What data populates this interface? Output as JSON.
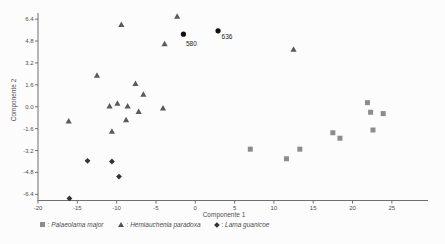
{
  "chart_data": {
    "type": "scatter",
    "title": "",
    "xlabel": "Componente 1",
    "ylabel": "Componente 2",
    "xlim": [
      -20,
      29.6
    ],
    "ylim": [
      -6.85,
      6.85
    ],
    "grid": false,
    "legend_position": "bottom",
    "x_ticks": [
      -20,
      -15,
      -10,
      -5,
      0,
      5,
      10,
      15,
      20,
      25
    ],
    "x_tick_labels": [
      "-20",
      "-15",
      "-10",
      "-5",
      "0",
      "5",
      "10",
      "15",
      "20",
      "25"
    ],
    "y_ticks": [
      6.4,
      4.8,
      3.2,
      1.6,
      0.0,
      -1.6,
      -3.2,
      -4.8,
      -6.4
    ],
    "y_tick_labels": [
      "6.4",
      "4.8",
      "3.2",
      "1.6",
      "0.0",
      "-1.6",
      "-3.2",
      "-4.8",
      "-6.4"
    ],
    "colors": {
      "background": "#fcfcfc",
      "axis": "#6f6f6f",
      "text": "#4d4d4d",
      "square_series": "#8c8c8c",
      "triangle_series": "#5a5a5a",
      "diamond_series": "#333333",
      "specimen_points": "#111111"
    },
    "series": [
      {
        "name": "Palaeolama major",
        "marker": "square",
        "color": "#8c8c8c",
        "in_legend": true,
        "points": [
          [
            7.0,
            -3.1
          ],
          [
            11.6,
            -3.8
          ],
          [
            13.3,
            -3.1
          ],
          [
            17.5,
            -1.9
          ],
          [
            18.4,
            -2.3
          ],
          [
            21.9,
            0.3
          ],
          [
            22.3,
            -0.4
          ],
          [
            23.9,
            -0.5
          ],
          [
            22.6,
            -1.7
          ]
        ]
      },
      {
        "name": "Hemiauchenia paradoxa",
        "marker": "triangle",
        "color": "#5a5a5a",
        "in_legend": true,
        "points": [
          [
            -2.3,
            6.6
          ],
          [
            -9.4,
            6.0
          ],
          [
            -3.9,
            4.6
          ],
          [
            12.5,
            4.2
          ],
          [
            -12.5,
            2.3
          ],
          [
            -7.6,
            1.7
          ],
          [
            -6.6,
            0.9
          ],
          [
            -9.9,
            0.25
          ],
          [
            -10.9,
            0.05
          ],
          [
            -8.6,
            0.05
          ],
          [
            -4.1,
            -0.1
          ],
          [
            -7.2,
            -0.35
          ],
          [
            -8.8,
            -0.95
          ],
          [
            -16.1,
            -1.05
          ],
          [
            -10.6,
            -1.8
          ]
        ]
      },
      {
        "name": "Lama guanicoe",
        "marker": "diamond",
        "color": "#333333",
        "in_legend": true,
        "points": [
          [
            -13.7,
            -3.95
          ],
          [
            -10.6,
            -4.0
          ],
          [
            -9.7,
            -5.1
          ],
          [
            -16.0,
            -6.7
          ]
        ]
      },
      {
        "name": "unidentified specimens",
        "marker": "circle",
        "color": "#111111",
        "in_legend": false,
        "points": [
          [
            -1.5,
            5.3
          ],
          [
            2.9,
            5.55
          ]
        ],
        "point_labels": [
          "580",
          "636"
        ],
        "label_offsets": [
          [
            2.5,
            6.5
          ],
          [
            3.5,
            3.5
          ]
        ]
      }
    ],
    "legend_separator": ": "
  }
}
